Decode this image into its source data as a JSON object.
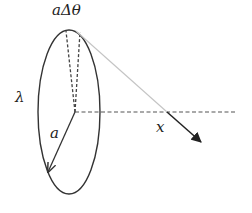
{
  "diagram": {
    "title": "",
    "labels": {
      "top": "aΔθ",
      "lambda": "λ",
      "radius": "a",
      "axis": "x"
    },
    "elements": {
      "ring": {
        "shape": "ellipse",
        "cx": 69,
        "cy": 112,
        "rx": 31,
        "ry": 82,
        "stroke": "#333333"
      },
      "center": {
        "x": 75,
        "y": 112
      },
      "arc_element_dashes": [
        {
          "from": [
            75,
            112
          ],
          "to": [
            66,
            31
          ]
        },
        {
          "from": [
            75,
            112
          ],
          "to": [
            80,
            32
          ]
        }
      ],
      "axis_dashed": {
        "from": [
          75,
          112
        ],
        "to": [
          236,
          112
        ],
        "stroke": "#444444"
      },
      "radius_arrow": {
        "from": [
          75,
          112
        ],
        "to": [
          48,
          172
        ],
        "stroke": "#333333"
      },
      "field_line": {
        "from": [
          76,
          31
        ],
        "to": [
          167,
          112
        ],
        "stroke": "#bbbbbb"
      },
      "field_arrow": {
        "from": [
          167,
          112
        ],
        "to": [
          201,
          142
        ],
        "stroke": "#222222"
      }
    },
    "colors": {
      "ink": "#333333",
      "light_line": "#bbbbbb",
      "background": "#ffffff"
    }
  }
}
